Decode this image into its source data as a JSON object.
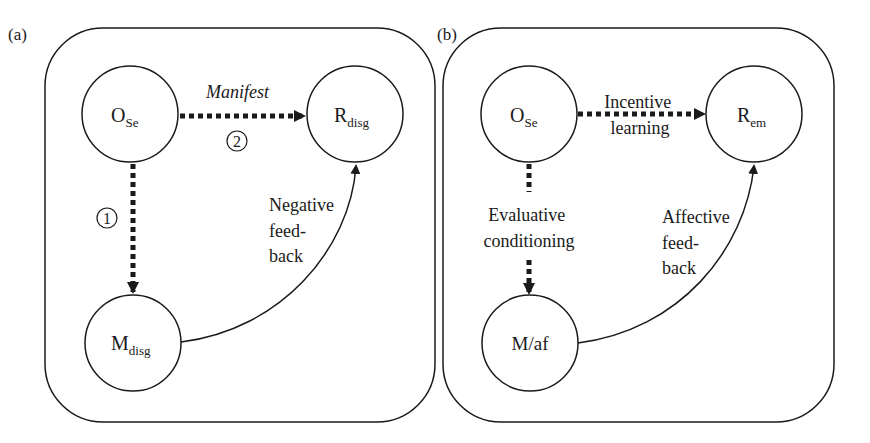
{
  "panels": [
    {
      "label": "(a)",
      "nodes": {
        "top_left": {
          "main": "O",
          "sub": "Se"
        },
        "top_right": {
          "main": "R",
          "sub": "disg"
        },
        "bottom_left": {
          "main": "M",
          "sub": "disg"
        }
      },
      "edges": {
        "horizontal_label": "Manifest",
        "horizontal_number": "2",
        "vertical_number": "1",
        "feedback_label": [
          "Negative",
          "feed-",
          "back"
        ]
      }
    },
    {
      "label": "(b)",
      "nodes": {
        "top_left": {
          "main": "O",
          "sub": "Se"
        },
        "top_right": {
          "main": "R",
          "sub": "em"
        },
        "bottom_left": {
          "main": "M/af",
          "sub": ""
        }
      },
      "edges": {
        "horizontal_label": [
          "Incentive",
          "learning"
        ],
        "vertical_label": [
          "Evaluative",
          "conditioning"
        ],
        "feedback_label": [
          "Affective",
          "feed-",
          "back"
        ]
      }
    }
  ],
  "colors": {
    "stroke": "#1a1a1a",
    "background": "#ffffff"
  }
}
